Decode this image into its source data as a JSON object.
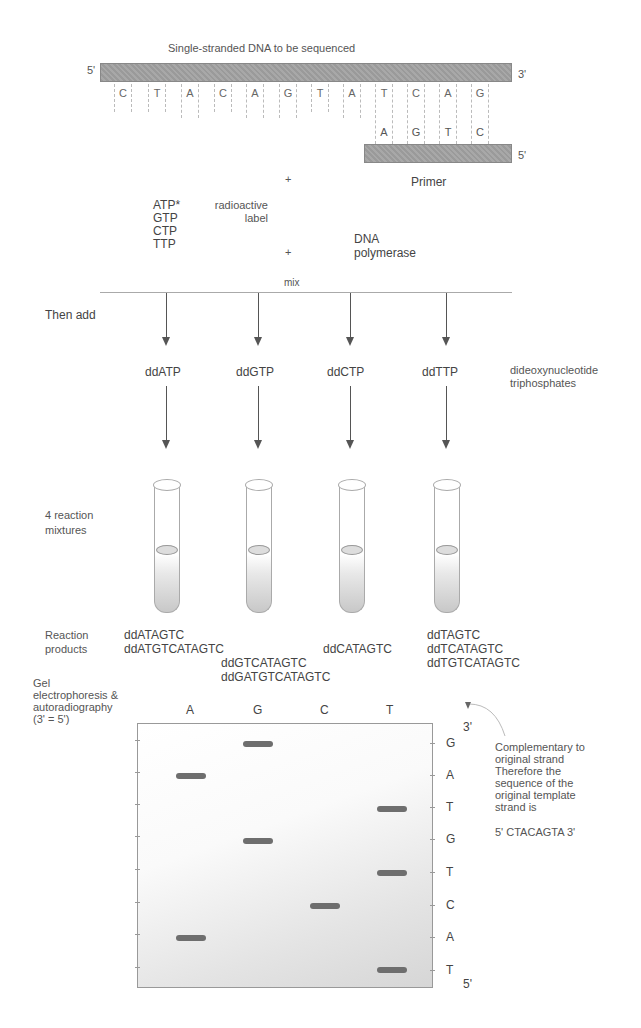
{
  "template_strand": {
    "title": "Single-stranded DNA to be sequenced",
    "end_left": "5'",
    "end_right": "3'",
    "bases": [
      "C",
      "T",
      "A",
      "C",
      "A",
      "G",
      "T",
      "A",
      "T",
      "C",
      "A",
      "G"
    ]
  },
  "primer": {
    "label": "Primer",
    "end_right": "5'",
    "bases": [
      "A",
      "G",
      "T",
      "C"
    ]
  },
  "mix": {
    "nucleotides": [
      "ATP*",
      "GTP",
      "CTP",
      "TTP"
    ],
    "radioactive_label": [
      "radioactive",
      "label"
    ],
    "plus_sign": "+",
    "enzyme": [
      "DNA",
      "polymerase"
    ],
    "mix_label": "mix"
  },
  "steps": {
    "then_add": "Then add",
    "reaction_mixtures": [
      "4 reaction",
      "mixtures"
    ],
    "reaction_products": [
      "Reaction",
      "products"
    ],
    "gel_label": [
      "Gel",
      "electrophoresis &",
      "autoradiography",
      "(3' = 5')"
    ]
  },
  "dideoxy": {
    "labels": [
      "ddATP",
      "ddGTP",
      "ddCTP",
      "ddTTP"
    ],
    "description": [
      "dideoxynucleotide",
      "triphosphates"
    ]
  },
  "products": {
    "A": [
      "ddATAGTC",
      "ddATGTCATAGTC"
    ],
    "G": [
      "ddGTCATAGTC",
      "ddGATGTCATAGTC"
    ],
    "C": [
      "ddCATAGTC"
    ],
    "T": [
      "ddTAGTC",
      "ddTCATAGTC",
      "ddTGTCATAGTC"
    ]
  },
  "gel": {
    "lanes": [
      "A",
      "G",
      "C",
      "T"
    ],
    "top_end": "3'",
    "bottom_end": "5'",
    "read_sequence": [
      "G",
      "A",
      "T",
      "G",
      "T",
      "C",
      "A",
      "T"
    ],
    "bands": [
      {
        "lane": "G",
        "row": 0
      },
      {
        "lane": "A",
        "row": 1
      },
      {
        "lane": "T",
        "row": 2
      },
      {
        "lane": "G",
        "row": 3
      },
      {
        "lane": "T",
        "row": 4
      },
      {
        "lane": "C",
        "row": 5
      },
      {
        "lane": "A",
        "row": 6
      },
      {
        "lane": "T",
        "row": 7
      }
    ]
  },
  "conclusion": {
    "lines": [
      "Complementary to",
      "original strand",
      "Therefore the",
      "sequence of the",
      "original template",
      "strand is"
    ],
    "sequence": "5' CTACAGTA 3'"
  }
}
